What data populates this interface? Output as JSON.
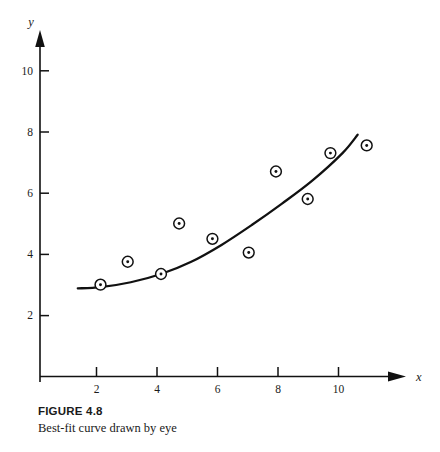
{
  "caption": {
    "title": "FIGURE 4.8",
    "text": "Best-fit curve drawn by eye"
  },
  "chart_data": {
    "type": "scatter",
    "title": "",
    "subtitle": "",
    "xlabel": "x",
    "ylabel": "y",
    "xlim": [
      0,
      12
    ],
    "ylim": [
      0,
      11.5
    ],
    "grid": false,
    "legend": null,
    "xticks": [
      2,
      4,
      6,
      8,
      10
    ],
    "xticklabels": [
      "2",
      "4",
      "6",
      "8",
      "10"
    ],
    "yticks": [
      2,
      4,
      6,
      8,
      10
    ],
    "yticklabels": [
      "2",
      "4",
      "6",
      "8",
      "10"
    ],
    "marker": "circle-with-center-dot",
    "axis_style": "arrowed-open-axes",
    "points": [
      {
        "x": 2.0,
        "y": 3.0
      },
      {
        "x": 2.9,
        "y": 3.75
      },
      {
        "x": 4.0,
        "y": 3.35
      },
      {
        "x": 4.6,
        "y": 5.0
      },
      {
        "x": 5.7,
        "y": 4.5
      },
      {
        "x": 6.9,
        "y": 4.05
      },
      {
        "x": 7.8,
        "y": 6.7
      },
      {
        "x": 8.85,
        "y": 5.8
      },
      {
        "x": 9.6,
        "y": 7.3
      },
      {
        "x": 10.8,
        "y": 7.55
      }
    ],
    "series": [
      {
        "name": "data points",
        "type": "scatter",
        "x": [
          2.0,
          2.9,
          4.0,
          4.6,
          5.7,
          6.9,
          7.8,
          8.85,
          9.6,
          10.8
        ],
        "values": [
          3.0,
          3.75,
          3.35,
          5.0,
          4.5,
          4.05,
          6.7,
          5.8,
          7.3,
          7.55
        ]
      },
      {
        "name": "best-fit curve drawn by eye",
        "type": "line",
        "x": [
          1.25,
          2.0,
          3.0,
          4.0,
          5.0,
          6.0,
          7.0,
          8.0,
          9.0,
          10.0,
          10.5
        ],
        "values": [
          2.88,
          2.92,
          3.08,
          3.35,
          3.75,
          4.3,
          4.95,
          5.65,
          6.4,
          7.3,
          7.9
        ]
      }
    ],
    "annotations": [
      {
        "text": "x",
        "role": "x-axis-name",
        "style": "italic"
      },
      {
        "text": "y",
        "role": "y-axis-name",
        "style": "italic"
      }
    ],
    "colors": {
      "ink": "#111111",
      "background": "#ffffff"
    }
  }
}
